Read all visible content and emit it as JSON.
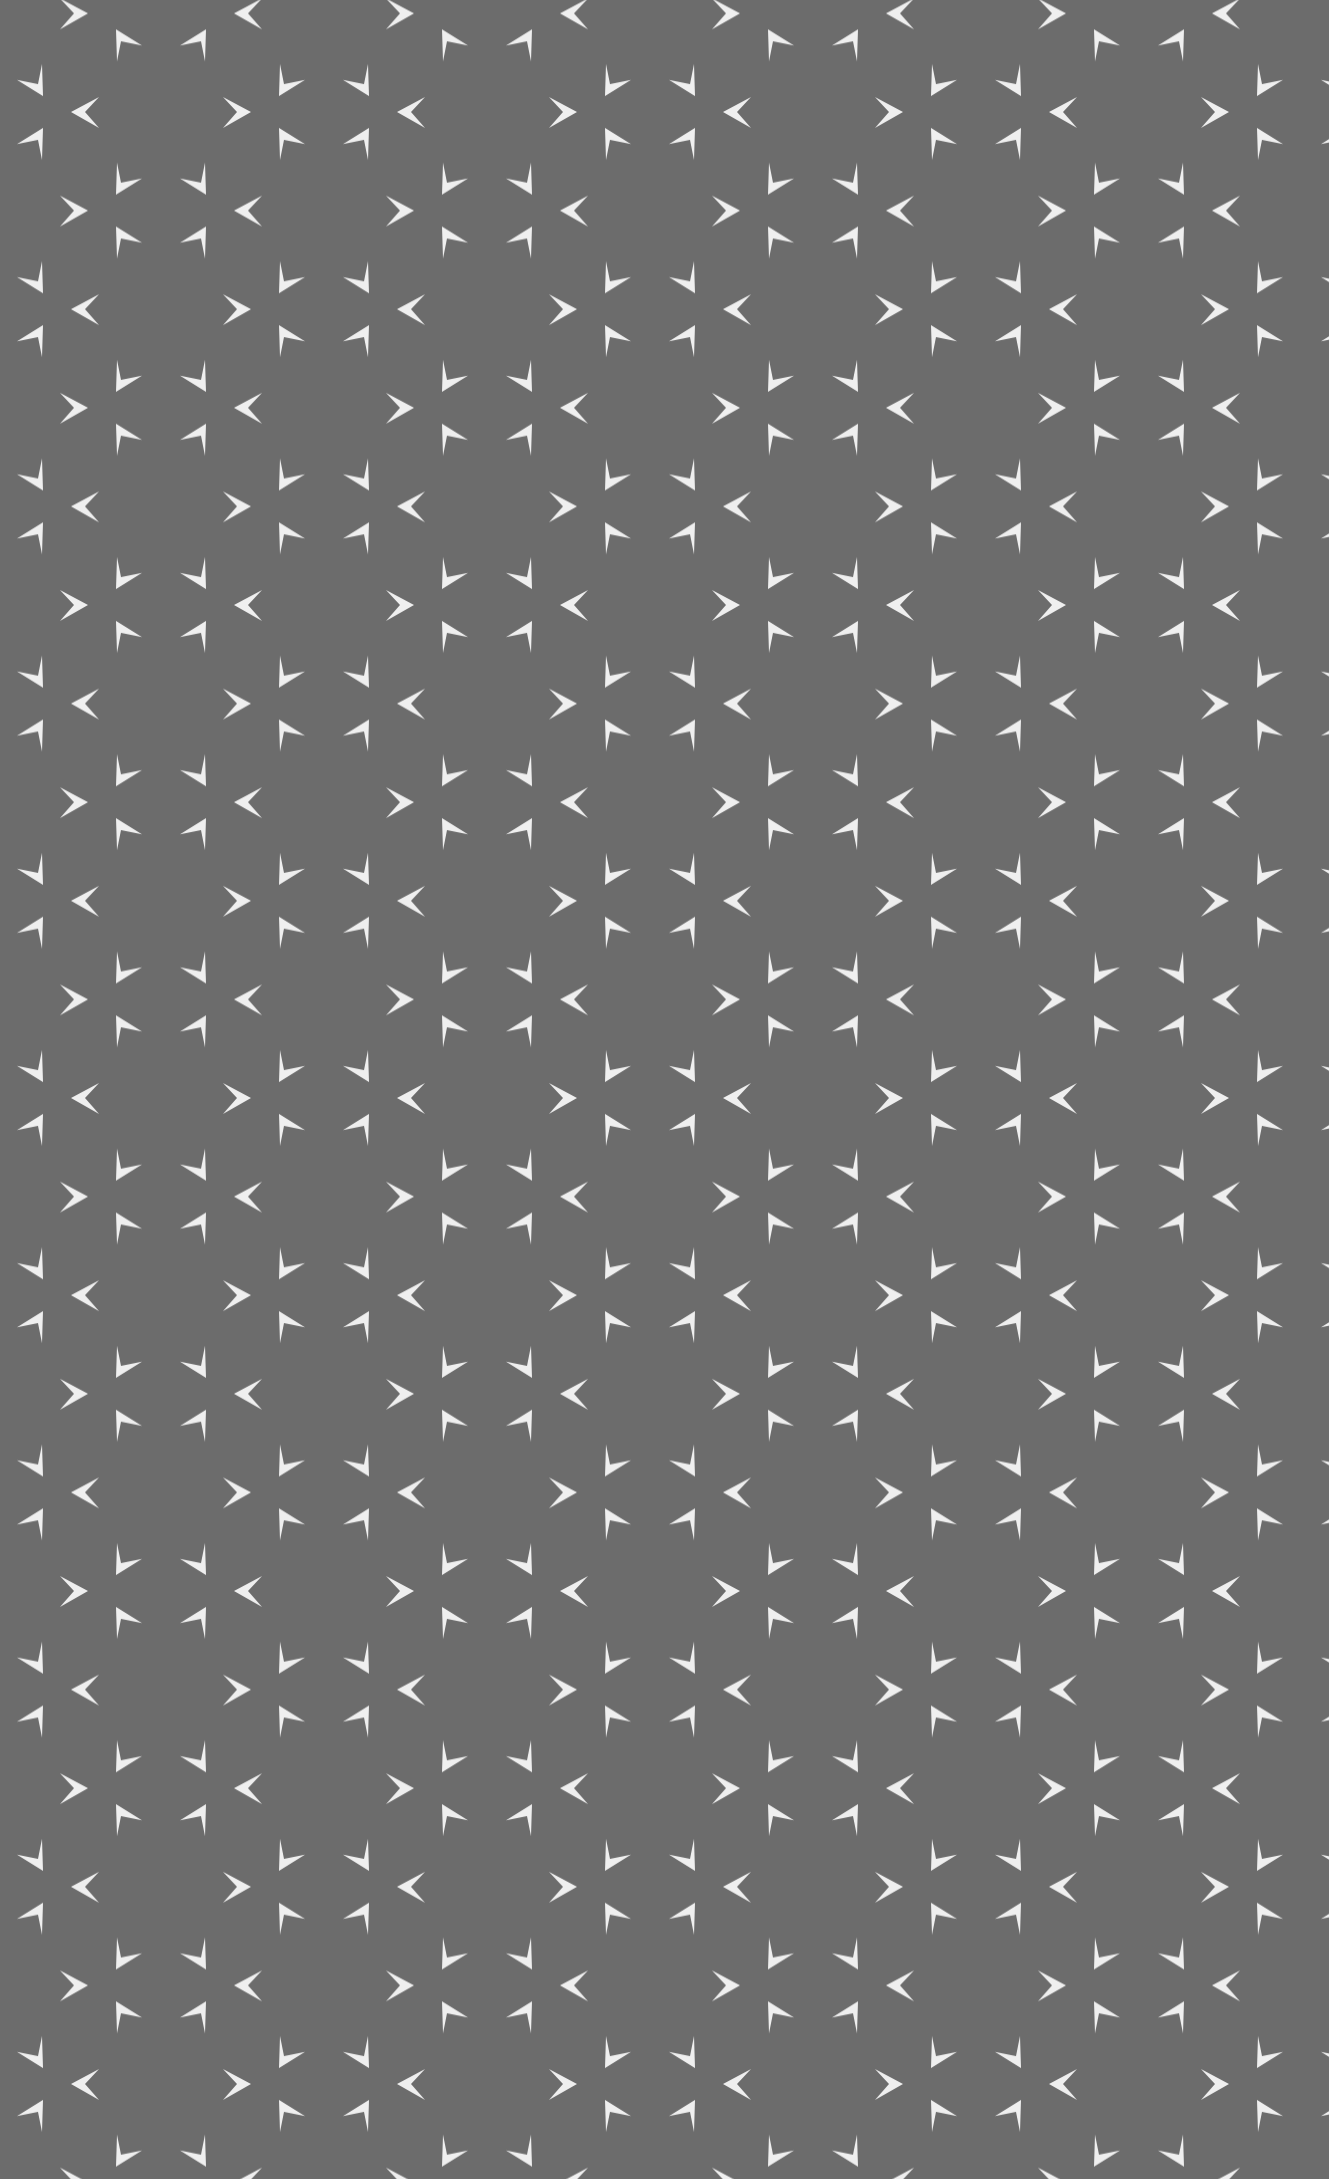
{
  "image": {
    "subject": "gray fabric with repeating white arrowhead motif",
    "width": 1329,
    "height": 2179
  },
  "pattern": {
    "background_color": "#6b6b6b",
    "arrow_color": "#f7f7f7",
    "motif": "cluster of six white arrowhead shapes arranged around a center",
    "tile_width": "326",
    "tile_height": "197.2",
    "offset_x": "-2",
    "offset_y": "112"
  }
}
